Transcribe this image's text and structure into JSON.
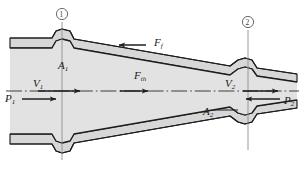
{
  "figure": {
    "kind": "engineering-schematic",
    "canvas": {
      "width": 303,
      "height": 173
    },
    "colors": {
      "background": "#ffffff",
      "duct_fill": "#d7d7d7",
      "interior_fill": "#e2e2e2",
      "outline": "#1c1c1c",
      "arrow": "#1f1f1f",
      "centerline": "#2b2b2b",
      "station_line": "#8f8f8f",
      "label_text": "#1a1a1a"
    }
  },
  "stations": [
    {
      "name": "station-1",
      "number": "1",
      "x": 62,
      "y": 14
    },
    {
      "name": "station-2",
      "number": "2",
      "x": 248,
      "y": 22
    }
  ],
  "labels": {
    "area_1": {
      "base": "A",
      "sub": "1",
      "x": 62,
      "y": 66
    },
    "area_2": {
      "base": "A",
      "sub": "2",
      "x": 211,
      "y": 112
    },
    "velocity_1": {
      "base": "V",
      "sub": "1",
      "x": 35,
      "y": 84
    },
    "velocity_2": {
      "base": "V",
      "sub": "2",
      "x": 228,
      "y": 84
    },
    "pressure_1": {
      "base": "P",
      "sub": "1",
      "x": 6,
      "y": 99
    },
    "pressure_2": {
      "base": "P",
      "sub": "2",
      "x": 283,
      "y": 101
    },
    "friction_force": {
      "base": "F",
      "sub": "f",
      "x": 155,
      "y": 42
    },
    "thrust_force": {
      "base": "F",
      "sub": "th",
      "x": 136,
      "y": 76
    }
  },
  "arrows": [
    {
      "name": "friction-force-arrow",
      "direction": "left",
      "from_x": 146,
      "to_x": 117,
      "y": 45
    },
    {
      "name": "thrust-force-arrow",
      "direction": "right",
      "from_x": 120,
      "to_x": 150,
      "y": 91
    },
    {
      "name": "velocity-1-arrow",
      "direction": "right",
      "from_x": 38,
      "to_x": 82,
      "y": 91
    },
    {
      "name": "velocity-2-arrow",
      "direction": "right",
      "from_x": 243,
      "to_x": 280,
      "y": 91
    },
    {
      "name": "pressure-1-arrow",
      "direction": "right",
      "from_x": 22,
      "to_x": 58,
      "y": 99
    },
    {
      "name": "pressure-2-arrow",
      "direction": "left",
      "from_x": 280,
      "to_x": 244,
      "y": 99
    }
  ],
  "geometry": {
    "centerline_y": 91,
    "duct_left_x": 10,
    "duct_right_x": 297,
    "inlet_wall_top_y": 54,
    "inlet_wall_bot_y": 128,
    "outlet_wall_top_y": 75,
    "outlet_wall_bot_y": 107
  }
}
